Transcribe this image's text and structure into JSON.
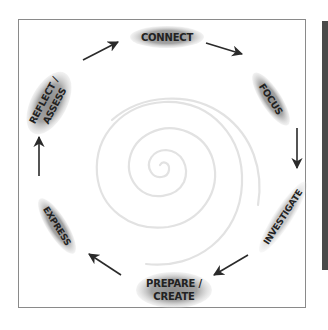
{
  "diagram": {
    "type": "cycle",
    "background_motif": "spiral",
    "colors": {
      "frame_border": "#8a8a8a",
      "node_fill": "#9a9a9a",
      "node_text": "#222222",
      "arrow": "#2a2a2a",
      "spiral": "#e4e4e4",
      "side_bar": "#4a4a4a"
    },
    "nodes": [
      {
        "id": "connect",
        "lines": [
          "CONNECT"
        ]
      },
      {
        "id": "focus",
        "lines": [
          "FOCUS"
        ]
      },
      {
        "id": "investigate",
        "lines": [
          "INVESTIGATE"
        ]
      },
      {
        "id": "prepare-create",
        "lines": [
          "PREPARE /",
          "CREATE"
        ]
      },
      {
        "id": "express",
        "lines": [
          "EXPRESS"
        ]
      },
      {
        "id": "reflect-assess",
        "lines": [
          "REFLECT /",
          "ASSESS"
        ]
      }
    ],
    "edges": [
      {
        "from": "connect",
        "to": "focus"
      },
      {
        "from": "focus",
        "to": "investigate"
      },
      {
        "from": "investigate",
        "to": "prepare-create"
      },
      {
        "from": "prepare-create",
        "to": "express"
      },
      {
        "from": "express",
        "to": "reflect-assess"
      },
      {
        "from": "reflect-assess",
        "to": "connect"
      }
    ]
  }
}
